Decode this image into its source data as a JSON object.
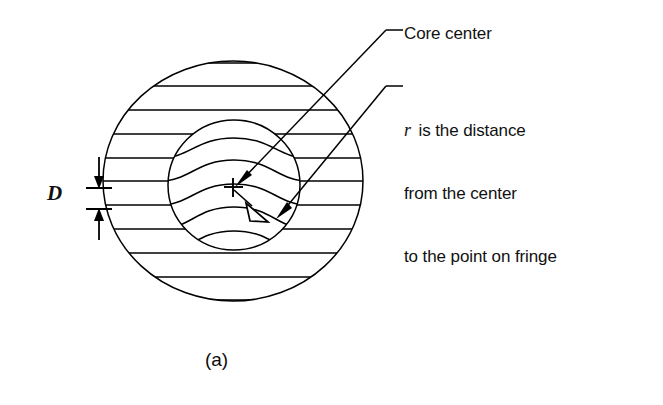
{
  "figure": {
    "caption": "(a)",
    "type": "technical-line-diagram",
    "background_color": "#ffffff",
    "line_color": "#000000"
  },
  "annotations": {
    "core_center": {
      "label": "Core center",
      "leader_from": [
        404,
        30
      ],
      "leader_to": [
        234,
        186
      ],
      "arrow_style": "solid"
    },
    "r_description": {
      "symbol": "r",
      "line1": " is the distance",
      "line2": "from the center",
      "line3": "to the point on fringe",
      "full_text": "r is the distance from the center to the point on fringe",
      "leader_from": [
        404,
        86
      ],
      "leader_to": [
        277,
        216
      ],
      "arrow_style": "solid"
    },
    "spacing_dimension": {
      "label": "D",
      "meaning": "fringe spacing",
      "tick_top_y": 188,
      "tick_bottom_y": 209,
      "tick_x_center": 99
    },
    "radius_vector": {
      "label": "r",
      "from": [
        234,
        188
      ],
      "to": [
        272,
        219
      ],
      "arrow_style": "hollow"
    }
  },
  "geometry": {
    "outer_circle": {
      "cx": 233,
      "cy": 181,
      "rx": 130,
      "ry": 120,
      "label": "cladding"
    },
    "inner_circle": {
      "cx": 234,
      "cy": 185,
      "rx": 66,
      "ry": 65,
      "label": "core"
    },
    "core_center_marker": {
      "x": 233,
      "y": 187,
      "glyph": "+"
    },
    "fringe_count": 11,
    "fringe_spacing_px": 24,
    "fringe_y_values": [
      86,
      110,
      134,
      158,
      181,
      205,
      229,
      253,
      277,
      300,
      62
    ]
  }
}
